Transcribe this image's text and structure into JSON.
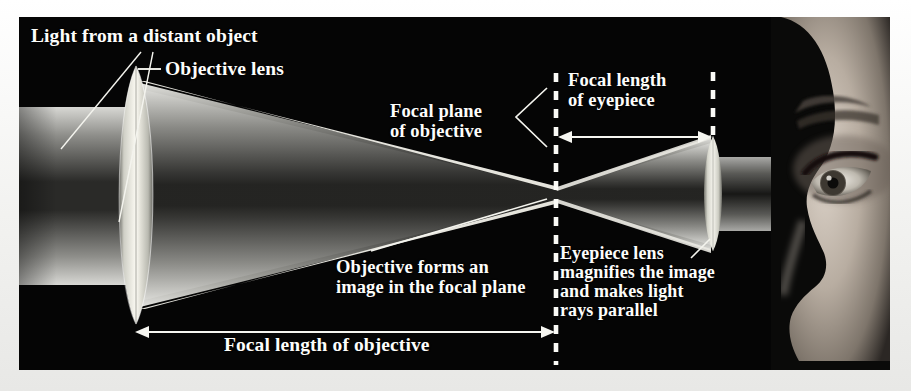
{
  "figure": {
    "domain": "diagram",
    "title_text": "",
    "background": "#050505",
    "frame_color": "#f2f2f0",
    "text_color": "#fdfdfb",
    "panel": {
      "x": 19,
      "y": 17,
      "width": 871,
      "height": 353
    }
  },
  "labels": {
    "light_from_distant_object": "Light from a distant object",
    "objective_lens": "Objective lens",
    "focal_plane_of_objective_line1": "Focal plane",
    "focal_plane_of_objective_line2": "of objective",
    "focal_length_of_eyepiece_line1": "Focal length",
    "focal_length_of_eyepiece_line2": "of eyepiece",
    "objective_forms_line1": "Objective forms an",
    "objective_forms_line2": "image in the focal plane",
    "eyepiece_line1": "Eyepiece lens",
    "eyepiece_line2": "magnifies the image",
    "eyepiece_line3": "and makes light",
    "eyepiece_line4": "rays parallel",
    "focal_length_of_objective": "Focal length of objective"
  },
  "optics": {
    "objective_lens": {
      "center_x": 117,
      "center_y": 178,
      "half_height": 129,
      "half_width": 21
    },
    "eyepiece_lens": {
      "center_x": 694,
      "center_y": 176,
      "half_height": 57,
      "half_width": 11
    },
    "focal_plane_x": 537,
    "focal_point": {
      "x": 538,
      "y": 178
    },
    "eyepiece_plane_x": 694,
    "incoming_beam": {
      "top_y": 90,
      "bottom_y": 268,
      "left_x": 0
    },
    "outgoing_beam": {
      "top_y": 152,
      "bottom_y": 202,
      "right_x": 871
    },
    "dimension_arrows": [
      {
        "name": "focal-length-of-objective",
        "x1": 118,
        "x2": 534,
        "y": 315
      },
      {
        "name": "focal-length-of-eyepiece",
        "x1": 540,
        "x2": 692,
        "y": 120
      }
    ],
    "dashed_lines": [
      {
        "name": "focal-plane-dashed",
        "x": 537,
        "y1": 56,
        "y2": 348
      },
      {
        "name": "eyepiece-plane-dashed",
        "x": 694,
        "y1": 55,
        "y2": 122
      }
    ]
  }
}
